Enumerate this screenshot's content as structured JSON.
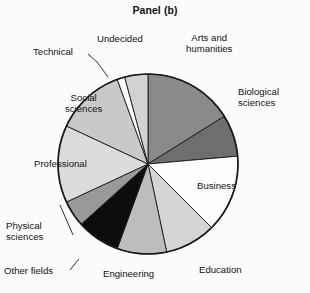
{
  "figure": {
    "title": "Panel (b)",
    "background_color": "#fcfcfc",
    "outline_color": "#1a1a1a"
  },
  "chart_data": {
    "type": "pie",
    "title": "Panel (b)",
    "xlabel": "",
    "ylabel": "",
    "legend_position": "none",
    "grid": false,
    "start_angle_deg": 0,
    "direction": "clockwise",
    "center": {
      "x": 148,
      "y": 164
    },
    "radius": 90,
    "categories": [
      "Arts and humanities",
      "Biological sciences",
      "Business",
      "Education",
      "Engineering",
      "Other fields",
      "Physical sciences",
      "Professional",
      "Social sciences",
      "Technical",
      "Undecided"
    ],
    "values": [
      16.1,
      7.5,
      13.9,
      9.2,
      8.9,
      7.8,
      4.7,
      13.9,
      12.5,
      1.4,
      4.1
    ],
    "colors": [
      "#8a8a8a",
      "#6e6e6e",
      "#fdfdfd",
      "#d5d5d5",
      "#bdbdbd",
      "#0d0d0d",
      "#999999",
      "#dcdcdc",
      "#c9c9c9",
      "#fbfbfb",
      "#d2d2d2"
    ],
    "slices": [
      {
        "label": "Arts and humanities",
        "value": 16.1,
        "start_deg": 0.0,
        "end_deg": 58.0,
        "color": "#8a8a8a"
      },
      {
        "label": "Biological sciences",
        "value": 7.5,
        "start_deg": 58.0,
        "end_deg": 85.0,
        "color": "#6e6e6e"
      },
      {
        "label": "Business",
        "value": 13.9,
        "start_deg": 85.0,
        "end_deg": 135.0,
        "color": "#fdfdfd"
      },
      {
        "label": "Education",
        "value": 9.2,
        "start_deg": 135.0,
        "end_deg": 168.0,
        "color": "#d5d5d5"
      },
      {
        "label": "Engineering",
        "value": 8.9,
        "start_deg": 168.0,
        "end_deg": 200.0,
        "color": "#bdbdbd"
      },
      {
        "label": "Other fields",
        "value": 7.8,
        "start_deg": 200.0,
        "end_deg": 228.0,
        "color": "#0d0d0d"
      },
      {
        "label": "Physical sciences",
        "value": 4.7,
        "start_deg": 228.0,
        "end_deg": 245.0,
        "color": "#999999"
      },
      {
        "label": "Professional",
        "value": 13.9,
        "start_deg": 245.0,
        "end_deg": 295.0,
        "color": "#dcdcdc"
      },
      {
        "label": "Social sciences",
        "value": 12.5,
        "start_deg": 295.0,
        "end_deg": 340.0,
        "color": "#c9c9c9"
      },
      {
        "label": "Technical",
        "value": 1.4,
        "start_deg": 340.0,
        "end_deg": 345.0,
        "color": "#fbfbfb"
      },
      {
        "label": "Undecided",
        "value": 4.1,
        "start_deg": 345.0,
        "end_deg": 360.0,
        "color": "#d2d2d2"
      }
    ]
  },
  "labels": {
    "arts_line1": "Arts and",
    "arts_line2": "humanities",
    "bio_line1": "Biological",
    "bio_line2": "sciences",
    "business": "Business",
    "education": "Education",
    "engineering": "Engineering",
    "other_fields": "Other fields",
    "physical_line1": "Physical",
    "physical_line2": "sciences",
    "professional": "Professional",
    "social_line1": "Social",
    "social_line2": "sciences",
    "technical": "Technical",
    "undecided": "Undecided"
  }
}
